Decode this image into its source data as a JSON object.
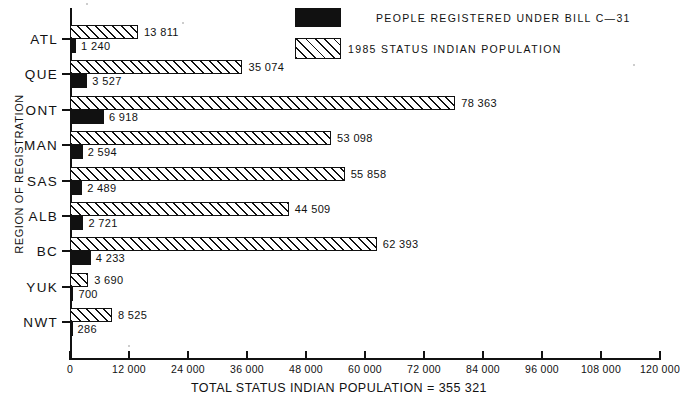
{
  "chart_data": {
    "type": "bar",
    "orientation": "horizontal",
    "title": "",
    "xlabel": "TOTAL STATUS INDIAN POPULATION  =  355 321",
    "ylabel": "REGION OF REGISTRATION",
    "categories": [
      "ATL",
      "QUE",
      "ONT",
      "MAN",
      "SAS",
      "ALB",
      "BC",
      "YUK",
      "NWT"
    ],
    "series": [
      {
        "name": "1985 STATUS INDIAN POPULATION",
        "pattern": "hatched",
        "values": [
          13811,
          35074,
          78363,
          53098,
          55858,
          44509,
          62393,
          3690,
          8525
        ],
        "labels": [
          "13 811",
          "35 074",
          "78 363",
          "53 098",
          "55 858",
          "44 509",
          "62 393",
          "3 690",
          "8 525"
        ]
      },
      {
        "name": "PEOPLE REGISTERED UNDER BILL C-31",
        "pattern": "solid-black",
        "values": [
          1240,
          3527,
          6918,
          2594,
          2489,
          2721,
          4233,
          700,
          286
        ],
        "labels": [
          "1 240",
          "3 527",
          "6 918",
          "2 594",
          "2 489",
          "2 721",
          "4 233",
          "700",
          "286"
        ]
      }
    ],
    "xlim": [
      0,
      120000
    ],
    "xticks": [
      0,
      12000,
      24000,
      36000,
      48000,
      60000,
      72000,
      84000,
      96000,
      108000,
      120000
    ],
    "xtick_labels": [
      "0",
      "12 000",
      "24 000",
      "36 000",
      "48 000",
      "60 000",
      "72 000",
      "84 000",
      "96 000",
      "108 000",
      "120 000"
    ],
    "grid": false,
    "legend_position": "top-right",
    "total_population": "355 321"
  },
  "legend": {
    "entries": [
      {
        "label": "PEOPLE REGISTERED UNDER BILL C—31",
        "swatch": "solid-black-swatch"
      },
      {
        "label": "1985 STATUS INDIAN POPULATION",
        "swatch": "hatched-swatch"
      }
    ]
  },
  "axes": {
    "y_title": "REGION OF REGISTRATION",
    "x_title": "TOTAL STATUS INDIAN POPULATION  =  355 321"
  }
}
